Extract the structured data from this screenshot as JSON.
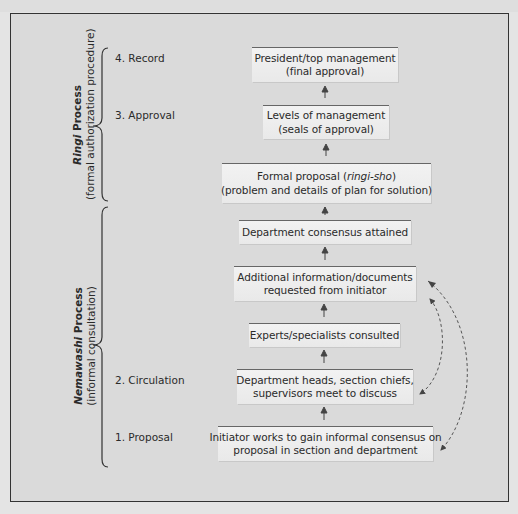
{
  "title_strip": {
    "text": ""
  },
  "groups": [
    {
      "title_italic": "Ringi",
      "title_rest": " Process",
      "subtitle": "(formal authorization procedure)"
    },
    {
      "title_italic": "Nemawashi",
      "title_rest": " Process",
      "subtitle": "(informal consultation)"
    }
  ],
  "stages": [
    {
      "label": "4. Record"
    },
    {
      "label": "3. Approval"
    },
    {
      "label": "2. Circulation"
    },
    {
      "label": "1. Proposal"
    }
  ],
  "steps": [
    {
      "line1": "President/top management",
      "line2": "(final approval)"
    },
    {
      "line1": "Levels of management",
      "line2": "(seals of approval)"
    },
    {
      "line1_pre": "Formal proposal (",
      "line1_italic": "ringi-sho",
      "line1_post": ")",
      "line2": "(problem and details of plan for solution)"
    },
    {
      "line1": "Department consensus attained"
    },
    {
      "line1": "Additional information/documents",
      "line2": "requested from initiator"
    },
    {
      "line1": "Experts/specialists consulted"
    },
    {
      "line1": "Department heads, section chiefs,",
      "line2": "supervisors meet to discuss"
    },
    {
      "line1": "Initiator works to gain informal consensus on",
      "line2": "proposal in section and department"
    }
  ],
  "colors": {
    "background": "#e4e4e4",
    "frame": "#dadada",
    "box": "#f0f0f0",
    "line": "#333333",
    "dashed": "#555555"
  }
}
